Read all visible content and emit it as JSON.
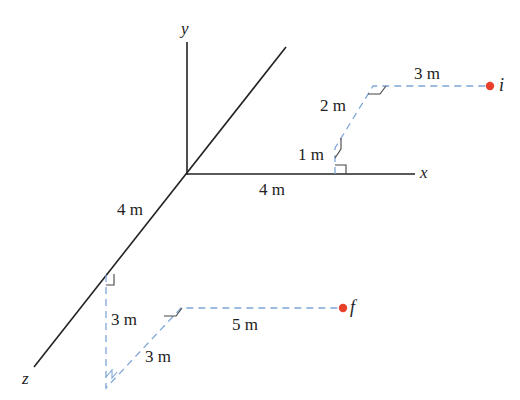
{
  "figure": {
    "type": "3d-displacement-diagram",
    "axes": {
      "x_label": "x",
      "y_label": "y",
      "z_label": "z"
    },
    "points": {
      "initial": {
        "label": "i",
        "color": "#e8402a"
      },
      "final": {
        "label": "f",
        "color": "#e8402a"
      }
    },
    "initial_path_labels": {
      "along_x": "4 m",
      "up_y": "1 m",
      "along_neg_z": "2 m",
      "along_x_to_i": "3 m"
    },
    "final_path_labels": {
      "along_z": "4 m",
      "down_y": "3 m",
      "along_neg_z": "3 m",
      "along_x_to_f": "5 m"
    },
    "colors": {
      "axis": "#222222",
      "dashed_path": "#7fa6d6",
      "point": "#e8402a"
    }
  }
}
